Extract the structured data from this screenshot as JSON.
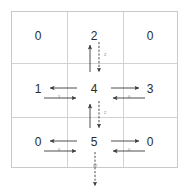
{
  "diagram": {
    "type": "grid-message-passing",
    "grid": {
      "rows": 3,
      "cols": 3,
      "border_color": "#c9c9c9",
      "divider_color": "#d2d2d2",
      "background": "#ffffff"
    },
    "cells": [
      {
        "id": "c00",
        "row": 0,
        "col": 0,
        "value": "0"
      },
      {
        "id": "c01",
        "row": 0,
        "col": 1,
        "value": "2"
      },
      {
        "id": "c02",
        "row": 0,
        "col": 2,
        "value": "0"
      },
      {
        "id": "c10",
        "row": 1,
        "col": 0,
        "value": "1"
      },
      {
        "id": "c11",
        "row": 1,
        "col": 1,
        "value": "4"
      },
      {
        "id": "c12",
        "row": 1,
        "col": 2,
        "value": "3"
      },
      {
        "id": "c20",
        "row": 2,
        "col": 0,
        "value": "0"
      },
      {
        "id": "c21",
        "row": 2,
        "col": 1,
        "value": "5"
      },
      {
        "id": "c22",
        "row": 2,
        "col": 2,
        "value": "0"
      }
    ],
    "edges": [
      {
        "id": "e-c11-c10",
        "from": "c11",
        "to": "c10",
        "direction": "left",
        "style": "solid",
        "label": ""
      },
      {
        "id": "e-c10-c11",
        "from": "c10",
        "to": "c11",
        "direction": "right",
        "style": "solid",
        "label": "1"
      },
      {
        "id": "e-c11-c12",
        "from": "c11",
        "to": "c12",
        "direction": "right",
        "style": "solid",
        "label": ""
      },
      {
        "id": "e-c12-c11",
        "from": "c12",
        "to": "c11",
        "direction": "left",
        "style": "solid",
        "label": "0"
      },
      {
        "id": "e-c21-c20",
        "from": "c21",
        "to": "c20",
        "direction": "left",
        "style": "solid",
        "label": ""
      },
      {
        "id": "e-c20-c21",
        "from": "c20",
        "to": "c21",
        "direction": "right",
        "style": "solid",
        "label": "0"
      },
      {
        "id": "e-c21-c22",
        "from": "c21",
        "to": "c22",
        "direction": "right",
        "style": "solid",
        "label": ""
      },
      {
        "id": "e-c22-c21",
        "from": "c22",
        "to": "c21",
        "direction": "left",
        "style": "solid",
        "label": "0"
      },
      {
        "id": "e-c11-c01",
        "from": "c11",
        "to": "c01",
        "direction": "up",
        "style": "solid",
        "label": ""
      },
      {
        "id": "e-c01-c11",
        "from": "c01",
        "to": "c11",
        "direction": "down",
        "style": "dashed",
        "label": "2"
      },
      {
        "id": "e-c21-c11",
        "from": "c21",
        "to": "c11",
        "direction": "up",
        "style": "solid",
        "label": ""
      },
      {
        "id": "e-c11-c21",
        "from": "c11",
        "to": "c21",
        "direction": "down",
        "style": "dashed",
        "label": "2"
      },
      {
        "id": "e-c21-out",
        "from": "c21",
        "to": "outside-bottom",
        "direction": "down",
        "style": "dashed",
        "label": "12"
      }
    ],
    "colors": {
      "text": "#2b2b2b",
      "arrow": "#3a3a3a",
      "label": "#6d6d6d"
    }
  }
}
